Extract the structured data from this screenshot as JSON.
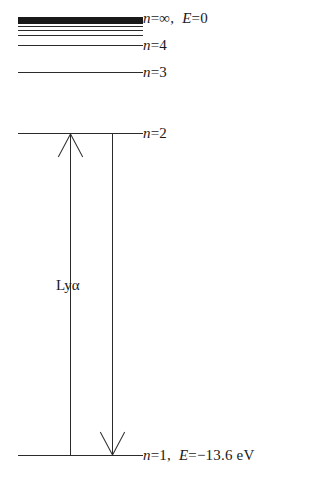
{
  "figure": {
    "type": "energy-level-diagram",
    "background_color": "#ffffff",
    "line_color": "#2b2b2b"
  },
  "levels": [
    {
      "id": "continuum",
      "n_symbol": "n",
      "n_value": "∞",
      "energy_text": "E=0",
      "label": "n=∞,  E=0",
      "label_prefix_italic": "n",
      "label_rest": "=∞,",
      "label_energy_italic": "E",
      "label_energy_rest": "=0"
    },
    {
      "id": "n4",
      "n_symbol": "n",
      "n_value": "4",
      "energy_text": "",
      "label": "n=4",
      "label_prefix_italic": "n",
      "label_rest": "=4"
    },
    {
      "id": "n3",
      "n_symbol": "n",
      "n_value": "3",
      "energy_text": "",
      "label": "n=3",
      "label_prefix_italic": "n",
      "label_rest": "=3"
    },
    {
      "id": "n2",
      "n_symbol": "n",
      "n_value": "2",
      "energy_text": "",
      "label": "n=2",
      "label_prefix_italic": "n",
      "label_rest": "=2"
    },
    {
      "id": "n1",
      "n_symbol": "n",
      "n_value": "1",
      "energy_text": "E=−13.6 eV",
      "label": "n=1,  E=−13.6  eV",
      "label_prefix_italic": "n",
      "label_rest": "=1,",
      "label_energy_italic": "E",
      "label_energy_rest": "=−13.6  eV"
    }
  ],
  "transitions": [
    {
      "id": "absorption",
      "name": "",
      "direction": "up",
      "from_level": "n1",
      "to_level": "n2"
    },
    {
      "id": "emission",
      "name": "Lyα",
      "direction": "down",
      "from_level": "n2",
      "to_level": "n1"
    }
  ],
  "transition_label": {
    "text": "Lyα",
    "greek_letter": "α",
    "series": "Lyman"
  }
}
